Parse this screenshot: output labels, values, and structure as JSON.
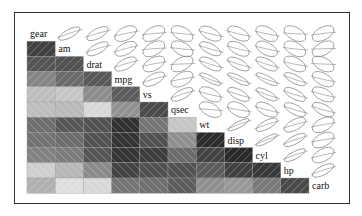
{
  "chart_data": {
    "type": "heatmap",
    "subtype": "corrgram",
    "title": "",
    "variables": [
      "gear",
      "am",
      "drat",
      "mpg",
      "vs",
      "qsec",
      "wt",
      "disp",
      "cyl",
      "hp",
      "carb"
    ],
    "lower_panel": "shade",
    "upper_panel": "ellipse",
    "diag_panel": "labels",
    "hatch": {
      "positive": "/",
      "negative": "\\"
    },
    "correlation": [
      [
        1.0,
        0.79,
        0.7,
        0.48,
        0.21,
        -0.21,
        -0.58,
        -0.56,
        -0.49,
        -0.13,
        0.27
      ],
      [
        0.79,
        1.0,
        0.71,
        0.6,
        0.17,
        -0.23,
        -0.69,
        -0.59,
        -0.52,
        -0.24,
        0.06
      ],
      [
        0.7,
        0.71,
        1.0,
        0.68,
        0.44,
        0.09,
        -0.71,
        -0.71,
        -0.7,
        -0.45,
        -0.09
      ],
      [
        0.48,
        0.6,
        0.68,
        1.0,
        0.66,
        0.42,
        -0.87,
        -0.85,
        -0.85,
        -0.78,
        -0.55
      ],
      [
        0.21,
        0.17,
        0.44,
        0.66,
        1.0,
        0.74,
        -0.55,
        -0.71,
        -0.81,
        -0.72,
        -0.57
      ],
      [
        -0.21,
        -0.23,
        0.09,
        0.42,
        0.74,
        1.0,
        -0.17,
        -0.43,
        -0.59,
        -0.71,
        -0.66
      ],
      [
        -0.58,
        -0.69,
        -0.71,
        -0.87,
        -0.55,
        -0.17,
        1.0,
        0.89,
        0.78,
        0.66,
        0.43
      ],
      [
        -0.56,
        -0.59,
        -0.71,
        -0.85,
        -0.71,
        -0.43,
        0.89,
        1.0,
        0.9,
        0.79,
        0.39
      ],
      [
        -0.49,
        -0.52,
        -0.7,
        -0.85,
        -0.81,
        -0.59,
        0.78,
        0.9,
        1.0,
        0.83,
        0.53
      ],
      [
        -0.13,
        -0.24,
        -0.45,
        -0.78,
        -0.72,
        -0.71,
        0.66,
        0.79,
        0.83,
        1.0,
        0.75
      ],
      [
        0.27,
        0.06,
        -0.09,
        -0.55,
        -0.57,
        -0.66,
        0.43,
        0.39,
        0.53,
        0.75,
        1.0
      ]
    ],
    "colors": {
      "frame": "#333333",
      "ellipse": "#888888",
      "grid": "#9a9a9a",
      "text": "#111111"
    }
  }
}
